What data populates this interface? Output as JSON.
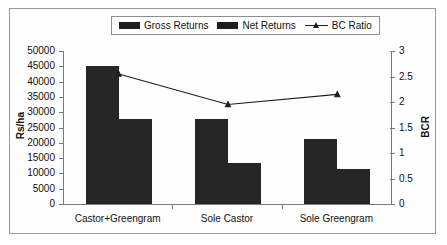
{
  "legend": {
    "items": [
      {
        "label": "Gross Returns",
        "marker": "filled-square-swatch"
      },
      {
        "label": "Net Returns",
        "marker": "filled-square-swatch"
      },
      {
        "label": "BC Ratio",
        "marker": "line-triangle-marker"
      }
    ]
  },
  "axes": {
    "left_title": "Rs/ha",
    "right_title": "BCR",
    "left_ticks": [
      "50000",
      "45000",
      "40000",
      "35000",
      "30000",
      "25000",
      "20000",
      "15000",
      "10000",
      "5000",
      "0"
    ],
    "right_ticks": [
      "3",
      "2.5",
      "2",
      "1.5",
      "1",
      "0.5",
      "0"
    ]
  },
  "chart_data": {
    "type": "bar",
    "title": "",
    "subtitle": "",
    "xlabel": "",
    "ylabel": "Rs/ha",
    "y2label": "BCR",
    "categories": [
      "Castor+Greengram",
      "Sole Castor",
      "Sole Greengram"
    ],
    "ylim": [
      0,
      50000
    ],
    "ytick_step": 5000,
    "y2lim": [
      0,
      3
    ],
    "y2tick_step": 0.5,
    "grid": false,
    "legend_position": "top-center",
    "series": [
      {
        "name": "Gross Returns",
        "type": "bar",
        "axis": "left",
        "color": "#262626",
        "values": [
          45200,
          27800,
          21100
        ]
      },
      {
        "name": "Net Returns",
        "type": "bar",
        "axis": "left",
        "color": "#262626",
        "values": [
          27800,
          13500,
          11300
        ]
      },
      {
        "name": "BC Ratio",
        "type": "line",
        "axis": "right",
        "color": "#1d1d1d",
        "marker": "triangle",
        "values": [
          2.55,
          1.95,
          2.15
        ]
      }
    ]
  }
}
